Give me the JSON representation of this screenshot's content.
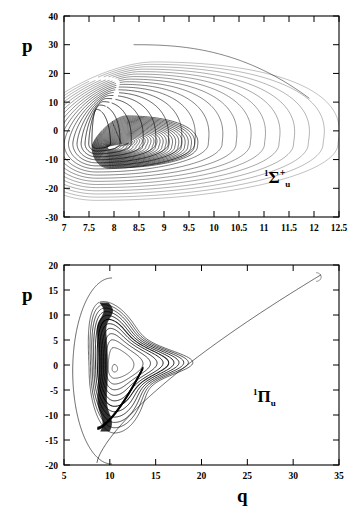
{
  "figure": {
    "axis_label_p_top": "p",
    "axis_label_p_bottom": "p",
    "axis_label_q": "q"
  },
  "panels": [
    {
      "id": "top-panel",
      "state_label": {
        "pre": "1",
        "symbol": "Σ",
        "post": "+",
        "sub": "u"
      },
      "xlabel": "",
      "ylabel": "p",
      "xticks": [
        "7",
        "7.5",
        "8",
        "8.5",
        "9",
        "9.5",
        "10",
        "10.5",
        "11",
        "11.5",
        "12",
        "12.5"
      ],
      "yticks": [
        "40",
        "30",
        "20",
        "10",
        "0",
        "-10",
        "-20",
        "-30"
      ],
      "xlim": [
        7,
        12.5
      ],
      "ylim": [
        -30,
        40
      ]
    },
    {
      "id": "bottom-panel",
      "state_label": {
        "pre": "1",
        "symbol": "Π",
        "post": "",
        "sub": "u"
      },
      "xlabel": "q",
      "ylabel": "p",
      "xticks": [
        "5",
        "10",
        "15",
        "20",
        "25",
        "30",
        "35"
      ],
      "yticks": [
        "20",
        "15",
        "10",
        "5",
        "0",
        "-5",
        "-10",
        "-15",
        "-20"
      ],
      "xlim": [
        5,
        35
      ],
      "ylim": [
        -20,
        20
      ]
    }
  ],
  "chart_data": [
    {
      "type": "line",
      "id": "top-phase-portrait",
      "title": "",
      "xlabel": "",
      "ylabel": "p",
      "xlim": [
        7,
        12.5
      ],
      "ylim": [
        -30,
        40
      ],
      "xticks": [
        7,
        7.5,
        8,
        8.5,
        9,
        9.5,
        10,
        10.5,
        11,
        11.5,
        12,
        12.5
      ],
      "yticks": [
        40,
        30,
        20,
        10,
        0,
        -10,
        -20,
        -30
      ],
      "grid": false,
      "legend": "none",
      "annotations": [
        {
          "text": "1Σ+u",
          "x": 11.6,
          "y": -13
        }
      ],
      "description": "Classical trajectory in (q,p) phase space forming a large outer loop that spirals inward into a dense dark rolled-up region near q=7.5-9, p=-10..12. Trajectory begins near (8.4, 30).",
      "series": [
        {
          "name": "trajectory",
          "color": "#000000",
          "start_point": [
            8.4,
            30
          ],
          "outer_loop_extent": {
            "q_min": 7.35,
            "q_max": 12.1,
            "p_min": -21,
            "p_max": 30
          },
          "inner_spiral_center": [
            7.65,
            -4.5
          ],
          "turning_point_right": [
            12.05,
            -3
          ],
          "n_windings": 18
        }
      ]
    },
    {
      "type": "line",
      "id": "bottom-phase-portrait",
      "title": "",
      "xlabel": "q",
      "ylabel": "p",
      "xlim": [
        5,
        35
      ],
      "ylim": [
        -20,
        20
      ],
      "xticks": [
        5,
        10,
        15,
        20,
        25,
        30,
        35
      ],
      "yticks": [
        20,
        15,
        10,
        5,
        0,
        -5,
        -10,
        -15,
        -20
      ],
      "grid": false,
      "legend": "none",
      "annotations": [
        {
          "text": "1Πu",
          "x": 26.5,
          "y": -7
        }
      ],
      "description": "Classical trajectory in (q,p) phase space with a long smooth excursion out to q=33, p=18, returning through a hooked inner structure with a dense dark bundle near q=8-13.",
      "series": [
        {
          "name": "trajectory",
          "color": "#000000",
          "outer_loop_extent": {
            "q_min": 6.1,
            "q_max": 33.0,
            "p_min": -19.5,
            "p_max": 18
          },
          "apex_point": [
            8.0,
            17.2
          ],
          "far_turning_point": [
            33.0,
            18.0
          ],
          "bottom_point": [
            8.6,
            -19.5
          ],
          "hook_point": [
            16.2,
            2.2
          ],
          "dense_bundle_region": {
            "q_min": 8.0,
            "q_max": 13.5,
            "p_min": -13,
            "p_max": 12.5
          },
          "n_windings": 12
        }
      ]
    }
  ]
}
